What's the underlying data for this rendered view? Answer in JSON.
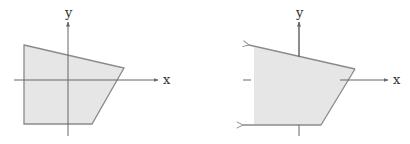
{
  "figures": [
    {
      "id": "left",
      "description": "bounded quadrilateral region",
      "axis_labels": {
        "x": "x",
        "y": "y"
      },
      "region_fill": "#e6e6e6",
      "stroke": "#888888"
    },
    {
      "id": "right",
      "description": "unbounded region extending left (arrows on top and bottom edges)",
      "axis_labels": {
        "x": "x",
        "y": "y"
      },
      "region_fill": "#e6e6e6",
      "stroke": "#888888"
    }
  ]
}
